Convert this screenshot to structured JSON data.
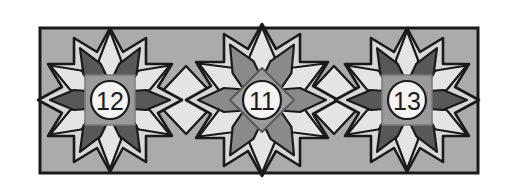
{
  "figure": {
    "canvas": {
      "width": 509,
      "height": 192
    }
  },
  "palette": {
    "page_background": "#ffffff",
    "band_fill": "#ababab",
    "band_stroke": "#1a1a1a",
    "petal_light": "#e4e4e4",
    "petal_dark": "#585858",
    "petal_medium": "#8a8a8a",
    "star_body": "#d8d8d8",
    "diamond_light": "#e4e4e4",
    "outline": "#1a1a1a",
    "badge_square_fill": "#9a9a9a",
    "badge_square_stroke": "#7a7a7a",
    "badge_circle_fill": "#f4f4f4",
    "badge_circle_stroke": "#1c1c1c",
    "badge_text": "#1c1c1c"
  },
  "band": {
    "x": 40,
    "y": 28,
    "width": 438,
    "height": 145
  },
  "rosettes": [
    {
      "id": "rosette-12",
      "label": "12",
      "badge_shape": "square",
      "center_x": 110,
      "center_y": 100,
      "petal_count": 12,
      "outer_radius": 72,
      "petal_style": "light-dark-alternating",
      "petal_colors": [
        "#e4e4e4",
        "#585858"
      ]
    },
    {
      "id": "rosette-11",
      "label": "11",
      "badge_shape": "diamond",
      "center_x": 262,
      "center_y": 100,
      "petal_count": 12,
      "outer_radius": 76,
      "petal_style": "light-medium-alternating",
      "petal_colors": [
        "#e4e4e4",
        "#8a8a8a"
      ]
    },
    {
      "id": "rosette-13",
      "label": "13",
      "badge_shape": "square",
      "center_x": 407,
      "center_y": 100,
      "petal_count": 12,
      "outer_radius": 72,
      "petal_style": "light-dark-alternating",
      "petal_colors": [
        "#e4e4e4",
        "#585858"
      ]
    }
  ],
  "junction_diamonds": [
    {
      "id": "junction-left",
      "center_x": 186,
      "center_y": 100
    },
    {
      "id": "junction-right",
      "center_x": 334,
      "center_y": 100
    }
  ]
}
